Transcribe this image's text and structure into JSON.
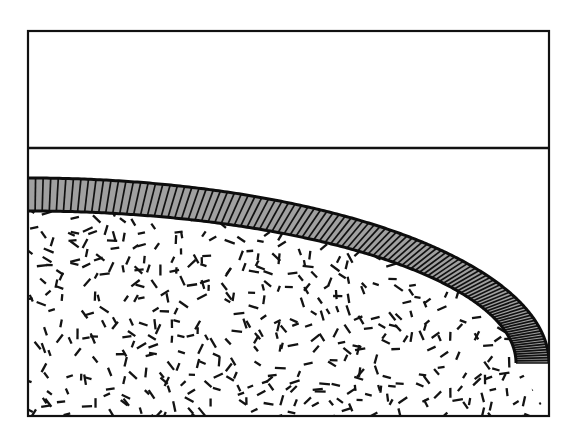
{
  "figure": {
    "canvas": {
      "width": 575,
      "height": 438,
      "background": "#ffffff"
    },
    "frame": {
      "name": "outer-rectangular-frame",
      "x": 28,
      "y": 31,
      "width": 521,
      "height": 385,
      "stroke": "#111111",
      "stroke_width": 2.2,
      "fill": "#ffffff"
    },
    "divider": {
      "name": "horizontal-divider-line",
      "x1": 28,
      "y1": 148,
      "x2": 549,
      "y2": 148,
      "stroke": "#111111",
      "stroke_width": 2.4
    },
    "upper_region": {
      "name": "empty-upper-band",
      "x": 28,
      "y": 31,
      "width": 521,
      "height": 117,
      "fill": "#ffffff",
      "label": ""
    },
    "gap_region": {
      "name": "white-gap-below-divider",
      "fill": "#ffffff"
    },
    "shell": {
      "name": "gray-ribbed-curved-layer",
      "fill": "#a0a0a0",
      "stroke": "#0d0d0d",
      "stroke_width": 3.0,
      "rib_stroke": "#111111",
      "rib_stroke_width": 1.7,
      "rib_count": 108,
      "thickness_px": 33,
      "outer_ellipse": {
        "cx": 28,
        "cy": 178,
        "rx": 521,
        "ry": 185
      },
      "inner_ellipse": {
        "cx": 28,
        "cy": 211,
        "rx": 488,
        "ry": 152
      },
      "arc_start_deg": 0,
      "arc_end_deg": 90,
      "left_top_y": 178,
      "left_bottom_y": 211,
      "right_touch_x": 549
    },
    "core": {
      "name": "stippled-core-region",
      "fill": "#ffffff",
      "texture": "random-short-dashes",
      "dash_color": "#131313",
      "dash_length_min": 6,
      "dash_length_max": 11,
      "dash_width": 2.3,
      "dash_count": 1450,
      "spacing_px": 13
    }
  },
  "chart_data": {
    "type": "area",
    "xlabel": "",
    "ylabel": "",
    "xlim": [
      28,
      549
    ],
    "ylim": [
      31,
      416
    ],
    "grid": false,
    "legend": "none",
    "series": [
      {
        "name": "divider-line",
        "kind": "line",
        "x": [
          28,
          549
        ],
        "y": [
          148,
          148
        ]
      },
      {
        "name": "shell-outer-boundary",
        "kind": "elliptical-arc",
        "center": [
          28,
          178
        ],
        "rx": 521,
        "ry": 185,
        "theta_deg": [
          0,
          90
        ]
      },
      {
        "name": "shell-inner-boundary",
        "kind": "elliptical-arc",
        "center": [
          28,
          211
        ],
        "rx": 488,
        "ry": 152,
        "theta_deg": [
          0,
          90
        ]
      }
    ],
    "annotations": []
  }
}
